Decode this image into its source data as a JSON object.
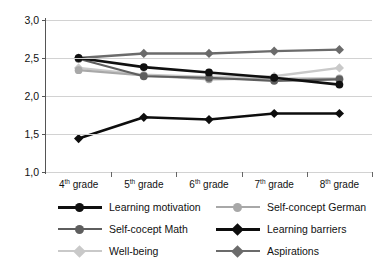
{
  "chart_data": {
    "type": "line",
    "title": "",
    "xlabel": "",
    "ylabel": "",
    "ylim": [
      1.0,
      3.0
    ],
    "grid": true,
    "legend_position": "bottom",
    "categories": [
      "4th grade",
      "5th grade",
      "6th grade",
      "7th grade",
      "8th grade"
    ],
    "category_labels": [
      {
        "num": "4",
        "sup": "th",
        "rest": " grade"
      },
      {
        "num": "5",
        "sup": "th",
        "rest": " grade"
      },
      {
        "num": "6",
        "sup": "th",
        "rest": " grade"
      },
      {
        "num": "7",
        "sup": "th",
        "rest": " grade"
      },
      {
        "num": "8",
        "sup": "th",
        "rest": " grade"
      }
    ],
    "ytick_labels": [
      "3,0",
      "2,5",
      "2,0",
      "1,5",
      "1,0"
    ],
    "ytick_values": [
      3.0,
      2.5,
      2.0,
      1.5,
      1.0
    ],
    "series": [
      {
        "name": "Learning motivation",
        "values": [
          2.5,
          2.38,
          2.31,
          2.24,
          2.15
        ],
        "color": "#101010",
        "marker": "circle",
        "width": 2.6
      },
      {
        "name": "Self-cocept Math",
        "values": [
          2.49,
          2.26,
          2.24,
          2.2,
          2.22
        ],
        "color": "#5e5e5e",
        "marker": "circle",
        "width": 2.2
      },
      {
        "name": "Well-being",
        "values": [
          2.37,
          2.28,
          2.25,
          2.26,
          2.37
        ],
        "color": "#c9c9c9",
        "marker": "diamond",
        "width": 2.4
      },
      {
        "name": "Self-concept German",
        "values": [
          2.34,
          2.27,
          2.22,
          2.23,
          2.23
        ],
        "color": "#a8a8a8",
        "marker": "circle",
        "width": 2.2
      },
      {
        "name": "Learning barriers",
        "values": [
          1.44,
          1.72,
          1.69,
          1.77,
          1.77
        ],
        "color": "#0d0d0d",
        "marker": "diamond",
        "width": 2.6
      },
      {
        "name": "Aspirations",
        "values": [
          2.5,
          2.56,
          2.56,
          2.59,
          2.61
        ],
        "color": "#6b6b6b",
        "marker": "diamond",
        "width": 2.4
      }
    ]
  },
  "legend": {
    "columns": [
      {
        "items": [
          {
            "label": "Learning motivation",
            "series_index": 0
          },
          {
            "label": "Self-cocept Math",
            "series_index": 1
          },
          {
            "label": "Well-being",
            "series_index": 2
          }
        ]
      },
      {
        "items": [
          {
            "label": "Self-concept German",
            "series_index": 3
          },
          {
            "label": "Learning barriers",
            "series_index": 4
          },
          {
            "label": "Aspirations",
            "series_index": 5
          }
        ]
      }
    ]
  },
  "colors": {
    "axis": "#555555",
    "grid": "#d2d2d2",
    "background": "#ffffff",
    "text": "#111111"
  }
}
